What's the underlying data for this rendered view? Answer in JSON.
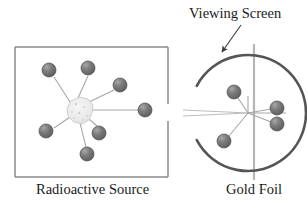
{
  "figure": {
    "background_color": "#ffffff",
    "width": 307,
    "height": 212
  },
  "labels": {
    "viewing_screen": "Viewing Screen",
    "radioactive_source": "Radioactive Source",
    "gold_foil": "Gold Foil"
  },
  "colors": {
    "sphere_fill": "#6b6b6b",
    "sphere_highlight": "#9a9a9a",
    "sphere_stroke": "#4a4a4a",
    "box_stroke": "#8a8a8a",
    "arc_stroke": "#555555",
    "foil_line": "#b5b5b5",
    "ray_stroke": "#9e9e9e",
    "beam_stroke": "#bdbdbd",
    "source_blob_fill": "#ededed",
    "source_blob_stroke": "#cfcfcf",
    "text_color": "#1a1a1a",
    "arrow_stroke": "#3a3a3a"
  },
  "source_box": {
    "x": 15,
    "y": 47,
    "width": 153,
    "height": 130,
    "gap_top": 104,
    "gap_bottom": 121
  },
  "source_blob": {
    "cx": 80,
    "cy": 110,
    "r": 13
  },
  "left_particles": [
    {
      "cx": 49,
      "cy": 70,
      "r": 7
    },
    {
      "cx": 88,
      "cy": 68,
      "r": 7
    },
    {
      "cx": 120,
      "cy": 85,
      "r": 7
    },
    {
      "cx": 145,
      "cy": 110,
      "r": 7
    },
    {
      "cx": 46,
      "cy": 131,
      "r": 7
    },
    {
      "cx": 99,
      "cy": 133,
      "r": 7
    },
    {
      "cx": 87,
      "cy": 154,
      "r": 7
    }
  ],
  "viewing_screen_arc": {
    "cx": 248,
    "cy": 113,
    "r": 58,
    "start_angle_deg": 152,
    "end_angle_deg": 208,
    "stroke_width": 2.6
  },
  "gold_foil_line": {
    "x": 254,
    "y_top": 44,
    "y_bottom": 180,
    "stroke_width": 2.2
  },
  "incident_beam": {
    "x_start": 183,
    "x_end": 248,
    "y_top": 110,
    "y_bottom": 116
  },
  "scatter_origin": {
    "x": 248,
    "y": 113
  },
  "right_particles": [
    {
      "cx": 234,
      "cy": 92,
      "r": 7
    },
    {
      "cx": 277,
      "cy": 108,
      "r": 7
    },
    {
      "cx": 277,
      "cy": 124,
      "r": 7
    },
    {
      "cx": 224,
      "cy": 141,
      "r": 7
    }
  ],
  "pointer_arrow": {
    "x_start": 241,
    "y_start": 25,
    "x_end": 222,
    "y_end": 52
  },
  "icons": {
    "alpha_particle": "sphere-icon",
    "radiation_source": "blob-icon",
    "detector": "arc-icon",
    "pointer": "arrow-icon"
  }
}
